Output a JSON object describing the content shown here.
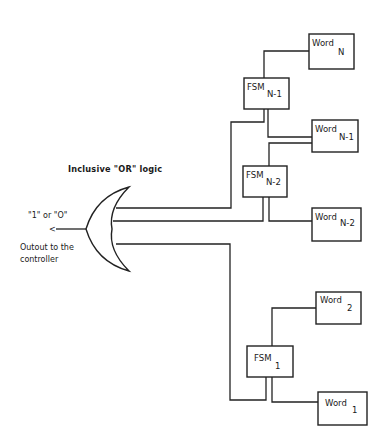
{
  "diagram": {
    "title": "Inclusive \"OR\" logic",
    "output": {
      "value_label": "\"1\" or \"O\"",
      "arrow": "<",
      "caption_line1": "Outout to the",
      "caption_line2": "controller"
    },
    "gate": {
      "type": "OR",
      "inputs": 3
    },
    "fsm_blocks": [
      {
        "id": "fsm_n_1",
        "base": "FSM",
        "sub": "N-1"
      },
      {
        "id": "fsm_n_2",
        "base": "FSM",
        "sub": "N-2"
      },
      {
        "id": "fsm_1",
        "base": "FSM",
        "sub": "1"
      }
    ],
    "word_blocks": [
      {
        "id": "word_n",
        "base": "Word",
        "sub": "N"
      },
      {
        "id": "word_n_1",
        "base": "Word",
        "sub": "N-1"
      },
      {
        "id": "word_n_2",
        "base": "Word",
        "sub": "N-2"
      },
      {
        "id": "word_2",
        "base": "Word",
        "sub": "2"
      },
      {
        "id": "word_1",
        "base": "Word",
        "sub": "1"
      }
    ],
    "connections": [
      [
        "word_n",
        "fsm_n_1"
      ],
      [
        "fsm_n_1",
        "word_n_1"
      ],
      [
        "fsm_n_1",
        "or_gate"
      ],
      [
        "word_n_1",
        "fsm_n_2"
      ],
      [
        "fsm_n_2",
        "word_n_2"
      ],
      [
        "fsm_n_2",
        "or_gate"
      ],
      [
        "word_2",
        "fsm_1"
      ],
      [
        "fsm_1",
        "word_1"
      ],
      [
        "fsm_1",
        "or_gate"
      ]
    ]
  }
}
